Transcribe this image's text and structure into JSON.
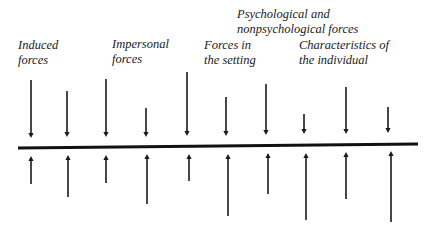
{
  "diagram": {
    "type": "force-field",
    "labels": [
      {
        "id": "induced",
        "lines": [
          "Induced",
          "forces"
        ],
        "x": 18,
        "y": 38
      },
      {
        "id": "impersonal",
        "lines": [
          "Impersonal",
          "forces"
        ],
        "x": 112,
        "y": 37
      },
      {
        "id": "setting",
        "lines": [
          "Forces in",
          "the setting"
        ],
        "x": 204,
        "y": 38
      },
      {
        "id": "psych",
        "lines": [
          "Psychological and",
          "nonpsychological forces"
        ],
        "x": 237,
        "y": 7
      },
      {
        "id": "individual",
        "lines": [
          "Characteristics of",
          "the individual"
        ],
        "x": 299,
        "y": 38
      }
    ],
    "baseline": {
      "x1": 18,
      "y1": 148,
      "x2": 418,
      "y2": 144,
      "stroke": "#111111",
      "width": 3
    },
    "down_arrows": [
      {
        "x": 31,
        "top": 80,
        "tip": 138
      },
      {
        "x": 67,
        "top": 91,
        "tip": 137
      },
      {
        "x": 106,
        "top": 79,
        "tip": 137
      },
      {
        "x": 146,
        "top": 108,
        "tip": 137
      },
      {
        "x": 187,
        "top": 72,
        "tip": 136
      },
      {
        "x": 226,
        "top": 97,
        "tip": 136
      },
      {
        "x": 266,
        "top": 84,
        "tip": 135
      },
      {
        "x": 304,
        "top": 114,
        "tip": 134
      },
      {
        "x": 346,
        "top": 87,
        "tip": 134
      },
      {
        "x": 388,
        "top": 107,
        "tip": 133
      }
    ],
    "up_arrows": [
      {
        "x": 31,
        "tip": 156,
        "bottom": 184
      },
      {
        "x": 68,
        "tip": 155,
        "bottom": 197
      },
      {
        "x": 106,
        "tip": 155,
        "bottom": 183
      },
      {
        "x": 147,
        "tip": 154,
        "bottom": 204
      },
      {
        "x": 189,
        "tip": 154,
        "bottom": 181
      },
      {
        "x": 228,
        "tip": 154,
        "bottom": 216
      },
      {
        "x": 268,
        "tip": 153,
        "bottom": 194
      },
      {
        "x": 306,
        "tip": 153,
        "bottom": 220
      },
      {
        "x": 346,
        "tip": 152,
        "bottom": 199
      },
      {
        "x": 391,
        "tip": 151,
        "bottom": 222
      }
    ],
    "stroke_color": "#1a1a1a"
  }
}
